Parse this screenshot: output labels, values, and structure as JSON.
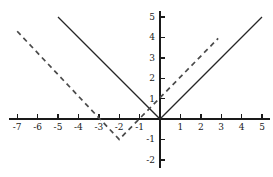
{
  "chart_data": {
    "type": "line",
    "title": "",
    "xlabel": "",
    "ylabel": "",
    "xlim": [
      -7.4,
      5.4
    ],
    "ylim": [
      -2.4,
      5.3
    ],
    "xticks": [
      -7,
      -6,
      -5,
      -4,
      -3,
      -2,
      -1,
      1,
      2,
      3,
      4,
      5
    ],
    "yticks": [
      -2,
      -1,
      1,
      2,
      3,
      4,
      5
    ],
    "xtick_labels": [
      "-7",
      "-6",
      "-5",
      "-4",
      "-3",
      "-2",
      "-1",
      "1",
      "2",
      "3",
      "4",
      "5"
    ],
    "ytick_labels": [
      "-2",
      "-1",
      "1",
      "2",
      "3",
      "4",
      "5"
    ],
    "grid": false,
    "legend": "none",
    "axis_color": "#1a1a1a",
    "series": [
      {
        "name": "y = |x|",
        "style": "solid",
        "color": "#262626",
        "points": [
          [
            -5,
            5
          ],
          [
            0,
            0
          ],
          [
            5,
            5
          ]
        ]
      },
      {
        "name": "y = |x+2| - 1",
        "style": "dashed",
        "color": "#4a4a4a",
        "dash_pattern": "5,4",
        "points": [
          [
            -7,
            4.3
          ],
          [
            -2,
            -1
          ],
          [
            2.85,
            3.95
          ]
        ]
      }
    ],
    "annotations": {
      "solid_vertex": [
        0,
        0
      ],
      "dashed_vertex": [
        -2,
        -1
      ],
      "dashed_x_intercepts": [
        -3,
        -1
      ],
      "dashed_y_intercept": 1
    }
  }
}
